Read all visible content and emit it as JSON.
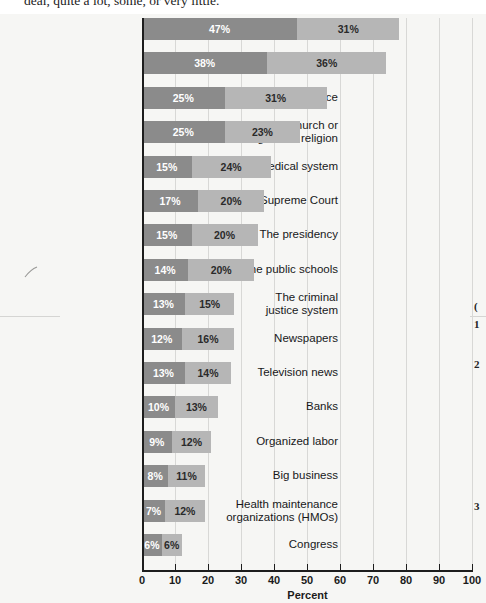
{
  "caption_fragment": "deal, quite a lot, some, or very little.",
  "axis": {
    "xlabel": "Percent",
    "ticks": [
      0,
      10,
      20,
      30,
      40,
      50,
      60,
      70,
      80,
      90,
      100
    ]
  },
  "colors": {
    "segment_a": "#8b8b8b",
    "segment_b": "#b6b6b6",
    "background": "#f6f6f4",
    "gridline": "#d8d8d6",
    "axis": "#1d1d1d"
  },
  "margin_notes": [
    "(",
    "1",
    "2",
    "3"
  ],
  "chart_data": {
    "type": "bar",
    "orientation": "horizontal",
    "stacked": true,
    "title": "",
    "xlabel": "Percent",
    "ylabel": "",
    "xlim": [
      0,
      100
    ],
    "grid": true,
    "legend_position": "none",
    "categories": [
      "The military",
      "Small business",
      "The police",
      "The church or organized religion",
      "The medical system",
      "The U.S. Supreme Court",
      "The presidency",
      "The public schools",
      "The criminal justice system",
      "Newspapers",
      "Television news",
      "Banks",
      "Organized labor",
      "Big business",
      "Health maintenance organizations (HMOs)",
      "Congress"
    ],
    "series": [
      {
        "name": "A great deal",
        "values": [
          47,
          38,
          25,
          25,
          15,
          17,
          15,
          14,
          13,
          12,
          13,
          10,
          9,
          8,
          7,
          6
        ]
      },
      {
        "name": "Quite a lot",
        "values": [
          31,
          36,
          31,
          23,
          24,
          20,
          20,
          20,
          15,
          16,
          14,
          13,
          12,
          11,
          12,
          6
        ]
      }
    ],
    "data_labels": [
      {
        "category": "The military",
        "a": "47%",
        "b": "31%"
      },
      {
        "category": "Small business",
        "a": "38%",
        "b": "36%"
      },
      {
        "category": "The police",
        "a": "25%",
        "b": "31%"
      },
      {
        "category": "The church or organized religion",
        "a": "25%",
        "b": "23%"
      },
      {
        "category": "The medical system",
        "a": "15%",
        "b": "24%"
      },
      {
        "category": "The U.S. Supreme Court",
        "a": "17%",
        "b": "20%"
      },
      {
        "category": "The presidency",
        "a": "15%",
        "b": "20%"
      },
      {
        "category": "The public schools",
        "a": "14%",
        "b": "20%"
      },
      {
        "category": "The criminal justice system",
        "a": "13%",
        "b": "15%"
      },
      {
        "category": "Newspapers",
        "a": "12%",
        "b": "16%"
      },
      {
        "category": "Television news",
        "a": "13%",
        "b": "14%"
      },
      {
        "category": "Banks",
        "a": "10%",
        "b": "13%"
      },
      {
        "category": "Organized labor",
        "a": "9%",
        "b": "12%"
      },
      {
        "category": "Big business",
        "a": "8%",
        "b": "11%"
      },
      {
        "category": "Health maintenance organizations (HMOs)",
        "a": "7%",
        "b": "12%"
      },
      {
        "category": "Congress",
        "a": "6%",
        "b": "6%"
      }
    ],
    "category_label_lines": [
      [
        "The military"
      ],
      [
        "Small business"
      ],
      [
        "The police"
      ],
      [
        "The church or",
        "organized religion"
      ],
      [
        "The medical system"
      ],
      [
        "The U.S. Supreme Court"
      ],
      [
        "The presidency"
      ],
      [
        "The public schools"
      ],
      [
        "The criminal",
        "justice system"
      ],
      [
        "Newspapers"
      ],
      [
        "Television news"
      ],
      [
        "Banks"
      ],
      [
        "Organized labor"
      ],
      [
        "Big business"
      ],
      [
        "Health maintenance",
        "organizations (HMOs)"
      ],
      [
        "Congress"
      ]
    ]
  }
}
